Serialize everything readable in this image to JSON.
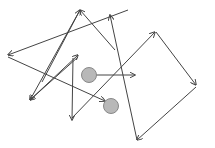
{
  "diagram": {
    "width": 215,
    "height": 148,
    "background": "#ffffff",
    "stroke_color": "#444444",
    "node_fill": "#b8b8b8",
    "node_stroke": "#888888",
    "nodes": [
      {
        "id": "node-1",
        "cx": 89,
        "cy": 75,
        "r": 7.5
      },
      {
        "id": "node-2",
        "cx": 111,
        "cy": 106,
        "r": 7.5
      }
    ],
    "arrows": [
      {
        "id": "arrow-1",
        "x1": 128,
        "y1": 10,
        "x2": 8,
        "y2": 55
      },
      {
        "id": "arrow-2",
        "x1": 8,
        "y1": 57,
        "x2": 105,
        "y2": 101
      },
      {
        "id": "arrow-3",
        "x1": 42,
        "y1": 82,
        "x2": 80,
        "y2": 10
      },
      {
        "id": "arrow-4",
        "x1": 115,
        "y1": 50,
        "x2": 80,
        "y2": 10
      },
      {
        "id": "arrow-5",
        "x1": 80,
        "y1": 10,
        "x2": 30,
        "y2": 100
      },
      {
        "id": "arrow-6",
        "x1": 78,
        "y1": 57,
        "x2": 30,
        "y2": 100
      },
      {
        "id": "arrow-7",
        "x1": 30,
        "y1": 100,
        "x2": 78,
        "y2": 55
      },
      {
        "id": "arrow-8",
        "x1": 73,
        "y1": 58,
        "x2": 72,
        "y2": 120
      },
      {
        "id": "arrow-9",
        "x1": 96,
        "y1": 75,
        "x2": 135,
        "y2": 75
      },
      {
        "id": "arrow-10",
        "x1": 137,
        "y1": 140,
        "x2": 110,
        "y2": 15
      },
      {
        "id": "arrow-11",
        "x1": 72,
        "y1": 118,
        "x2": 155,
        "y2": 32
      },
      {
        "id": "arrow-12",
        "x1": 156,
        "y1": 32,
        "x2": 196,
        "y2": 85
      },
      {
        "id": "arrow-13",
        "x1": 196,
        "y1": 87,
        "x2": 137,
        "y2": 140
      }
    ]
  }
}
